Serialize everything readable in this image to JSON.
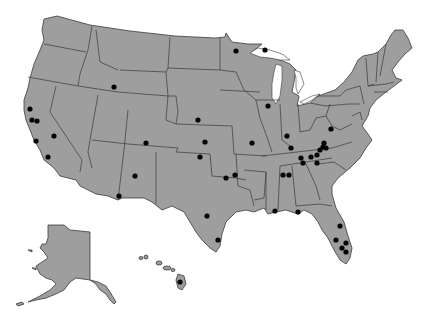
{
  "map": {
    "title": "United States locations map",
    "region": "United States",
    "insets": [
      "Alaska",
      "Hawaii"
    ],
    "colors": {
      "land": "#9e9e9e",
      "border": "#3a3a3a",
      "water": "#ffffff",
      "marker": "#050505"
    },
    "marker_count": 43,
    "markers": [
      {
        "id": 1,
        "region": "Idaho/Utah",
        "x": 114,
        "y": 87
      },
      {
        "id": 2,
        "region": "Minnesota",
        "x": 236,
        "y": 51
      },
      {
        "id": 3,
        "region": "Lake Superior (Wisconsin/Michigan)",
        "x": 265,
        "y": 50
      },
      {
        "id": 4,
        "region": "California North",
        "x": 30,
        "y": 109
      },
      {
        "id": 5,
        "region": "California Bay Area",
        "x": 32,
        "y": 120
      },
      {
        "id": 6,
        "region": "California Bay Area",
        "x": 37,
        "y": 121
      },
      {
        "id": 7,
        "region": "California Central Coast",
        "x": 36,
        "y": 141
      },
      {
        "id": 8,
        "region": "California Central",
        "x": 54,
        "y": 136
      },
      {
        "id": 9,
        "region": "California South",
        "x": 48,
        "y": 157
      },
      {
        "id": 10,
        "region": "Nebraska",
        "x": 198,
        "y": 120
      },
      {
        "id": 11,
        "region": "Kansas",
        "x": 205,
        "y": 142
      },
      {
        "id": 12,
        "region": "Kansas/Oklahoma",
        "x": 200,
        "y": 157
      },
      {
        "id": 13,
        "region": "Colorado",
        "x": 146,
        "y": 143
      },
      {
        "id": 14,
        "region": "New Mexico",
        "x": 135,
        "y": 176
      },
      {
        "id": 15,
        "region": "New Mexico South",
        "x": 119,
        "y": 196
      },
      {
        "id": 16,
        "region": "Illinois",
        "x": 268,
        "y": 106
      },
      {
        "id": 17,
        "region": "Missouri",
        "x": 252,
        "y": 143
      },
      {
        "id": 18,
        "region": "Indiana South",
        "x": 287,
        "y": 136
      },
      {
        "id": 19,
        "region": "Kentucky",
        "x": 291,
        "y": 148
      },
      {
        "id": 20,
        "region": "West Virginia",
        "x": 331,
        "y": 129
      },
      {
        "id": 21,
        "region": "Tennessee",
        "x": 301,
        "y": 158
      },
      {
        "id": 22,
        "region": "Tennessee",
        "x": 311,
        "y": 157
      },
      {
        "id": 23,
        "region": "Tennessee",
        "x": 317,
        "y": 155
      },
      {
        "id": 24,
        "region": "Tennessee",
        "x": 320,
        "y": 150
      },
      {
        "id": 25,
        "region": "Kentucky/Virginia",
        "x": 323,
        "y": 147
      },
      {
        "id": 26,
        "region": "Virginia",
        "x": 324,
        "y": 143
      },
      {
        "id": 27,
        "region": "Virginia",
        "x": 326,
        "y": 148
      },
      {
        "id": 28,
        "region": "Tennessee East",
        "x": 317,
        "y": 163
      },
      {
        "id": 29,
        "region": "Tennessee",
        "x": 303,
        "y": 163
      },
      {
        "id": 30,
        "region": "Oklahoma",
        "x": 226,
        "y": 178
      },
      {
        "id": 31,
        "region": "Arkansas",
        "x": 235,
        "y": 175
      },
      {
        "id": 32,
        "region": "Mississippi",
        "x": 283,
        "y": 175
      },
      {
        "id": 33,
        "region": "Alabama",
        "x": 289,
        "y": 175
      },
      {
        "id": 34,
        "region": "Texas",
        "x": 207,
        "y": 216
      },
      {
        "id": 35,
        "region": "Texas Gulf Coast",
        "x": 218,
        "y": 240
      },
      {
        "id": 36,
        "region": "Mississippi Coast",
        "x": 275,
        "y": 211
      },
      {
        "id": 37,
        "region": "Florida Panhandle",
        "x": 298,
        "y": 212
      },
      {
        "id": 38,
        "region": "Florida Central",
        "x": 340,
        "y": 226
      },
      {
        "id": 39,
        "region": "Florida West",
        "x": 336,
        "y": 240
      },
      {
        "id": 40,
        "region": "Florida East",
        "x": 346,
        "y": 243
      },
      {
        "id": 41,
        "region": "Florida South",
        "x": 342,
        "y": 248
      },
      {
        "id": 42,
        "region": "Florida South",
        "x": 346,
        "y": 252
      },
      {
        "id": 43,
        "region": "Hawaii",
        "x": 180,
        "y": 282
      }
    ]
  }
}
